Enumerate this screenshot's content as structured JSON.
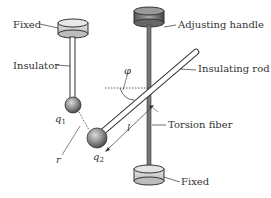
{
  "diagram": {
    "type": "torsion-balance",
    "labels": {
      "fixed_top": "Fixed",
      "insulator": "Insulator",
      "adjusting_handle": "Adjusting handle",
      "insulating_rod": "Insulating rod",
      "torsion_fiber": "Torsion fiber",
      "fixed_bottom": "Fixed"
    },
    "symbols": {
      "phi": "φ",
      "q1": "q",
      "q1_sub": "1",
      "q2": "q",
      "q2_sub": "2",
      "r": "r",
      "l": "l"
    },
    "colors": {
      "line": "#333333",
      "disc_fill": "#cfcfcf",
      "handle_fill": "#888888",
      "sphere": "#8a8a8a"
    }
  }
}
